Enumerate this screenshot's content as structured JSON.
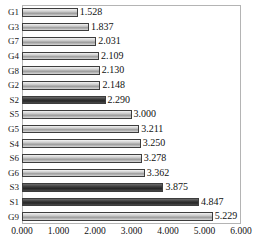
{
  "chart_data": {
    "type": "bar",
    "orientation": "horizontal",
    "title": "",
    "subtitle": "",
    "xlabel": "",
    "ylabel": "",
    "xlim": [
      0,
      6
    ],
    "ylim": null,
    "grid": false,
    "legend": null,
    "legend_position": "none",
    "xticks": [
      "0.000",
      "1.000",
      "2.000",
      "3.000",
      "4.000",
      "5.000",
      "6.000"
    ],
    "xtick_values": [
      0,
      1,
      2,
      3,
      4,
      5,
      6
    ],
    "categories": [
      "G1",
      "G3",
      "G7",
      "G4",
      "G8",
      "G2",
      "S2",
      "S5",
      "G5",
      "S4",
      "S6",
      "G6",
      "S3",
      "S1",
      "G9"
    ],
    "values": [
      1.528,
      1.837,
      2.031,
      2.109,
      2.13,
      2.148,
      2.29,
      3.0,
      3.211,
      3.25,
      3.278,
      3.362,
      3.875,
      4.847,
      5.229
    ],
    "value_labels": [
      "1.528",
      "1.837",
      "2.031",
      "2.109",
      "2.130",
      "2.148",
      "2.290",
      "3.000",
      "3.211",
      "3.250",
      "3.278",
      "3.362",
      "3.875",
      "4.847",
      "5.229"
    ],
    "bar_styles": [
      "light",
      "light",
      "light",
      "light",
      "light",
      "light",
      "dark",
      "light",
      "light",
      "light",
      "light",
      "light",
      "dark",
      "dark",
      "light"
    ],
    "colors": {
      "bar_light": "#c9c9c9",
      "bar_dark": "#333333",
      "bar_border": "#3d3d3d",
      "frame": "#b4b4b4",
      "text": "#111111",
      "background": "#ffffff"
    }
  }
}
